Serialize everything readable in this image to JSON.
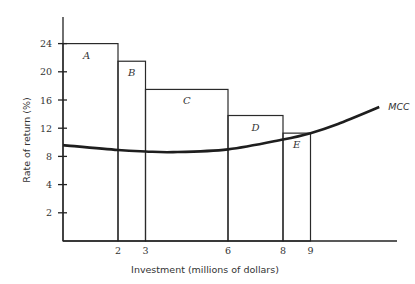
{
  "chart_data": {
    "type": "bar",
    "title": "",
    "xlabel": "Investment (millions of dollars)",
    "ylabel": "Rate of return (%)",
    "xlim": [
      0,
      12
    ],
    "ylim": [
      0,
      28
    ],
    "x_ticks": [
      2,
      3,
      6,
      8,
      9
    ],
    "y_ticks": [
      {
        "label": "2",
        "position": 4
      },
      {
        "label": "4",
        "position": 8
      },
      {
        "label": "8",
        "position": 12
      },
      {
        "label": "12",
        "position": 16
      },
      {
        "label": "16",
        "position": 20
      },
      {
        "label": "20",
        "position": 24
      },
      {
        "label": "24",
        "position": 28
      }
    ],
    "bars": [
      {
        "label": "A",
        "x_start": 0,
        "x_end": 2,
        "value": 24
      },
      {
        "label": "B",
        "x_start": 2,
        "x_end": 3,
        "value": 21.5
      },
      {
        "label": "C",
        "x_start": 3,
        "x_end": 6,
        "value": 17.5
      },
      {
        "label": "D",
        "x_start": 6,
        "x_end": 8,
        "value": 13.8
      },
      {
        "label": "E",
        "x_start": 8,
        "x_end": 9,
        "value": 11.3
      }
    ],
    "series": [
      {
        "name": "MCC",
        "type": "line",
        "x": [
          0,
          2,
          3,
          4,
          6,
          8,
          9,
          10,
          11.5
        ],
        "y": [
          9.6,
          8.9,
          8.7,
          8.6,
          9.0,
          10.4,
          11.3,
          12.6,
          15.0
        ]
      }
    ],
    "grid": false,
    "legend": "none"
  }
}
